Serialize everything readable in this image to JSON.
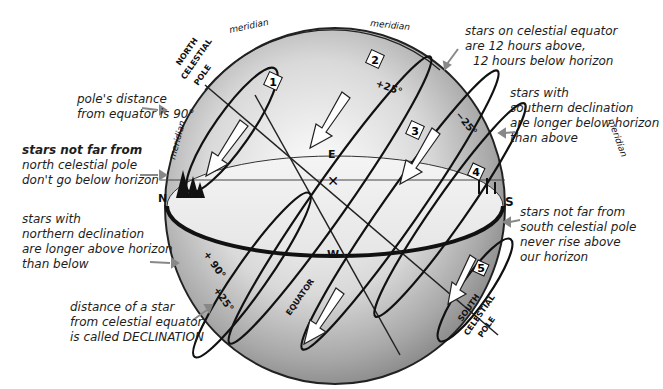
{
  "diagram": {
    "type": "celestial-sphere"
  },
  "annotations": {
    "pole_distance": [
      "pole's distance",
      "from equator is 90°"
    ],
    "circumpolar_north": [
      "stars not far from",
      "north celestial pole",
      "don't go below horizon"
    ],
    "northern_declination": [
      "stars with",
      "northern declination",
      "are longer above horizon",
      "than below"
    ],
    "declination_def": [
      "distance of a star",
      "from celestial equator",
      "is called DECLINATION"
    ],
    "equator_stars": [
      "stars on celestial equator",
      "are 12 hours above,",
      "12 hours below horizon"
    ],
    "southern_declination": [
      "stars with",
      "southern declination",
      "are longer below horizon",
      "than above"
    ],
    "circumpolar_south": [
      "stars not far from",
      "south celestial pole",
      "never rise above",
      "our horizon"
    ]
  },
  "labels": {
    "north_pole": "NORTH CELESTIAL POLE",
    "south_pole": "SOUTH CELESTIAL POLE",
    "meridian": "meridian",
    "equator": "EQUATOR",
    "east": "E",
    "west": "W",
    "north": "N",
    "south": "S",
    "angle_pole": "+ 90°",
    "angle_plus25_top": "+25°",
    "angle_plus25_bottom": "+25°",
    "angle_minus25": "−25°"
  },
  "star_paths": [
    {
      "number": "1",
      "declination": "near north pole"
    },
    {
      "number": "2",
      "declination": "+25°"
    },
    {
      "number": "3",
      "declination": "0° (equator)"
    },
    {
      "number": "4",
      "declination": "−25°"
    },
    {
      "number": "5",
      "declination": "near south pole"
    }
  ]
}
